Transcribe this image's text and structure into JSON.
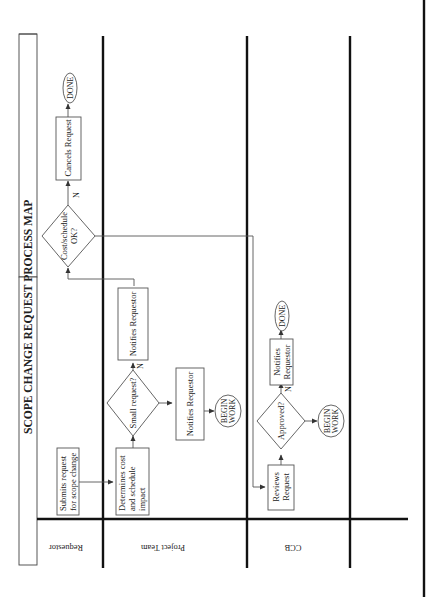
{
  "diagram": {
    "title": "SCOPE CHANGE REQUEST PROCESS MAP",
    "orientation": "rotated-90-ccw",
    "lanes": [
      {
        "id": "requestor",
        "label": "Requestor"
      },
      {
        "id": "project_team",
        "label": "Project Team"
      },
      {
        "id": "ccb",
        "label": "CCB"
      },
      {
        "id": "empty",
        "label": ""
      }
    ],
    "nodes": {
      "submit": {
        "type": "process",
        "lane": "requestor",
        "lines": [
          "Submits request",
          "for scope change"
        ]
      },
      "determine": {
        "type": "process",
        "lane": "project_team",
        "lines": [
          "Determines cost",
          "and schedule",
          "impact"
        ]
      },
      "small": {
        "type": "decision",
        "lane": "project_team",
        "lines": [
          "Small request?"
        ]
      },
      "notify_pt_n": {
        "type": "process",
        "lane": "project_team",
        "lines": [
          "Notifies Requestor"
        ]
      },
      "notify_pt_y": {
        "type": "process",
        "lane": "project_team",
        "lines": [
          "Notifies Requestor"
        ]
      },
      "begin_pt": {
        "type": "terminal",
        "lane": "project_team",
        "lines": [
          "BEGIN",
          "WORK"
        ]
      },
      "costok": {
        "type": "decision",
        "lane": "requestor",
        "lines": [
          "Cost/schedule",
          "OK?"
        ]
      },
      "cancel": {
        "type": "process",
        "lane": "requestor",
        "lines": [
          "Cancels Request"
        ]
      },
      "done_req": {
        "type": "terminal",
        "lane": "requestor",
        "lines": [
          "DONE"
        ]
      },
      "reviews": {
        "type": "process",
        "lane": "ccb",
        "lines": [
          "Reviews",
          "Request"
        ]
      },
      "approved": {
        "type": "decision",
        "lane": "ccb",
        "lines": [
          "Approved?"
        ]
      },
      "notify_ccb": {
        "type": "process",
        "lane": "ccb",
        "lines": [
          "Notifies",
          "Requestor"
        ]
      },
      "done_ccb": {
        "type": "terminal",
        "lane": "ccb",
        "lines": [
          "DONE"
        ]
      },
      "begin_ccb": {
        "type": "terminal",
        "lane": "ccb",
        "lines": [
          "BEGIN",
          "WORK"
        ]
      }
    },
    "branch_labels": {
      "small_no": "N",
      "costok_no": "N",
      "approved_no": "N"
    },
    "edges": [
      {
        "from": "submit",
        "to": "determine"
      },
      {
        "from": "determine",
        "to": "small"
      },
      {
        "from": "small",
        "to": "notify_pt_n",
        "label": "N"
      },
      {
        "from": "small",
        "to": "notify_pt_y"
      },
      {
        "from": "notify_pt_y",
        "to": "begin_pt"
      },
      {
        "from": "notify_pt_n",
        "to": "costok"
      },
      {
        "from": "costok",
        "to": "cancel",
        "label": "N"
      },
      {
        "from": "cancel",
        "to": "done_req"
      },
      {
        "from": "costok",
        "to": "reviews"
      },
      {
        "from": "reviews",
        "to": "approved"
      },
      {
        "from": "approved",
        "to": "notify_ccb",
        "label": "N"
      },
      {
        "from": "notify_ccb",
        "to": "done_ccb"
      },
      {
        "from": "approved",
        "to": "begin_ccb"
      }
    ]
  }
}
